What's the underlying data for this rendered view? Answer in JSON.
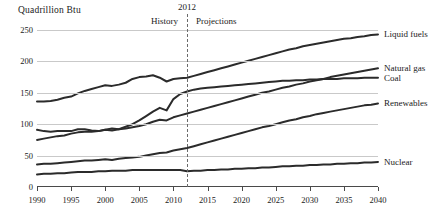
{
  "chart_data": {
    "type": "line",
    "title": "Quadrillion Btu",
    "xlabel": "",
    "ylabel": "Quadrillion Btu",
    "xlim": [
      1990,
      2040
    ],
    "ylim": [
      0,
      250
    ],
    "yticks": [
      0,
      50,
      100,
      150,
      200,
      250
    ],
    "xticks": [
      1990,
      1995,
      2000,
      2005,
      2010,
      2015,
      2020,
      2025,
      2030,
      2035,
      2040
    ],
    "grid": "horizontal",
    "legend_position": "right-of-lines",
    "annotations": {
      "divider_year": 2012,
      "divider_label": "2012",
      "left_region": "History",
      "right_region": "Projections"
    },
    "x": [
      1990,
      1991,
      1992,
      1993,
      1994,
      1995,
      1996,
      1997,
      1998,
      1999,
      2000,
      2001,
      2002,
      2003,
      2004,
      2005,
      2006,
      2007,
      2008,
      2009,
      2010,
      2011,
      2012,
      2013,
      2014,
      2015,
      2016,
      2017,
      2018,
      2019,
      2020,
      2021,
      2022,
      2023,
      2024,
      2025,
      2026,
      2027,
      2028,
      2029,
      2030,
      2031,
      2032,
      2033,
      2034,
      2035,
      2036,
      2037,
      2038,
      2039,
      2040
    ],
    "series": [
      {
        "name": "Liquid fuels",
        "color": "#2b2b2b",
        "values": [
          136,
          136,
          137,
          139,
          142,
          144,
          149,
          153,
          156,
          159,
          162,
          161,
          163,
          166,
          172,
          175,
          176,
          178,
          174,
          168,
          172,
          173,
          174,
          177,
          180,
          183,
          186,
          189,
          192,
          195,
          198,
          201,
          204,
          207,
          210,
          213,
          216,
          219,
          221,
          224,
          226,
          228,
          230,
          232,
          234,
          236,
          237,
          239,
          240,
          242,
          243
        ]
      },
      {
        "name": "Natural gas",
        "color": "#2b2b2b",
        "values": [
          75,
          77,
          79,
          81,
          82,
          85,
          87,
          88,
          88,
          89,
          91,
          90,
          92,
          93,
          95,
          97,
          100,
          104,
          107,
          106,
          111,
          114,
          117,
          120,
          123,
          126,
          129,
          132,
          135,
          138,
          141,
          144,
          147,
          150,
          152,
          155,
          158,
          160,
          163,
          165,
          168,
          170,
          172,
          175,
          177,
          179,
          181,
          183,
          185,
          187,
          189
        ]
      },
      {
        "name": "Coal",
        "color": "#2b2b2b",
        "values": [
          91,
          89,
          88,
          89,
          89,
          89,
          92,
          92,
          90,
          89,
          91,
          93,
          92,
          96,
          100,
          106,
          113,
          120,
          126,
          122,
          140,
          148,
          152,
          155,
          157,
          158,
          159,
          160,
          161,
          162,
          163,
          164,
          165,
          166,
          167,
          168,
          169,
          169,
          170,
          170,
          171,
          171,
          172,
          172,
          172,
          173,
          173,
          173,
          174,
          174,
          174
        ]
      },
      {
        "name": "Renewables",
        "color": "#2b2b2b",
        "values": [
          36,
          37,
          37,
          38,
          39,
          40,
          41,
          42,
          42,
          43,
          44,
          43,
          45,
          46,
          47,
          48,
          50,
          52,
          54,
          55,
          58,
          60,
          62,
          65,
          68,
          71,
          74,
          77,
          80,
          83,
          86,
          89,
          92,
          95,
          97,
          100,
          103,
          106,
          108,
          111,
          113,
          116,
          118,
          120,
          122,
          124,
          126,
          128,
          130,
          131,
          133
        ]
      },
      {
        "name": "Nuclear",
        "color": "#2b2b2b",
        "values": [
          20,
          21,
          21,
          22,
          22,
          23,
          24,
          24,
          24,
          25,
          25,
          26,
          26,
          26,
          27,
          27,
          27,
          27,
          27,
          27,
          27,
          27,
          25,
          26,
          26,
          27,
          27,
          28,
          28,
          29,
          29,
          30,
          30,
          31,
          31,
          32,
          33,
          33,
          34,
          34,
          35,
          35,
          36,
          36,
          37,
          37,
          38,
          38,
          39,
          39,
          40
        ]
      }
    ],
    "legend_labels": [
      "Liquid fuels",
      "Natural gas",
      "Coal",
      "Renewables",
      "Nuclear"
    ]
  }
}
